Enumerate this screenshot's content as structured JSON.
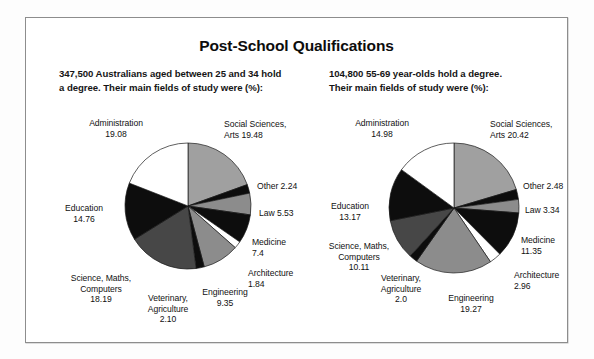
{
  "title": "Post-School Qualifications",
  "captions": {
    "left": "347,500 Australians aged between 25 and 34 hold\na degree. Their main fields of study were (%):",
    "right": "104,800 55-69 year-olds hold a degree.\nTheir main fields of study were (%):"
  },
  "colors": {
    "gray_light": "#a0a0a0",
    "gray_mid": "#8c8c8c",
    "gray_dark": "#474747",
    "black": "#0d0d0d",
    "white": "#ffffff",
    "border": "#8d8d8d",
    "text": "#111111"
  },
  "chart_data": [
    {
      "type": "pie",
      "title": "347,500 Australians aged between 25 and 34 hold a degree. Their main fields of study were (%):",
      "group": "25-34 year-olds",
      "total_people": "347,500",
      "unit": "%",
      "start_angle": 0,
      "direction": "clockwise",
      "categories": [
        "Social Sciences, Arts",
        "Other",
        "Law",
        "Medicine",
        "Architecture",
        "Engineering",
        "Veterinary, Agriculture",
        "Science, Maths, Computers",
        "Education",
        "Administration"
      ],
      "values": [
        19.48,
        2.24,
        5.53,
        7.4,
        1.84,
        9.35,
        2.1,
        18.19,
        14.76,
        19.08
      ],
      "slice_colors": [
        "#a0a0a0",
        "#0d0d0d",
        "#8c8c8c",
        "#0d0d0d",
        "#ffffff",
        "#8c8c8c",
        "#0d0d0d",
        "#474747",
        "#0d0d0d",
        "#ffffff"
      ],
      "labels": [
        {
          "name": "Social Sciences,\nArts  19.48",
          "value": 19.48
        },
        {
          "name": "Other  2.24",
          "value": 2.24
        },
        {
          "name": "Law  5.53",
          "value": 5.53
        },
        {
          "name": "Medicine\n7.4",
          "value": 7.4
        },
        {
          "name": "Architecture\n1.84",
          "value": 1.84
        },
        {
          "name": "Engineering\n9.35",
          "value": 9.35
        },
        {
          "name": "Veterinary,\nAgriculture\n2.10",
          "value": 2.1
        },
        {
          "name": "Science, Maths,\nComputers\n18.19",
          "value": 18.19
        },
        {
          "name": "Education\n14.76",
          "value": 14.76
        },
        {
          "name": "Administration\n19.08",
          "value": 19.08
        }
      ]
    },
    {
      "type": "pie",
      "title": "104,800 55-69 year-olds hold a degree. Their main fields of study were (%):",
      "group": "55-69 year-olds",
      "total_people": "104,800",
      "unit": "%",
      "start_angle": 0,
      "direction": "clockwise",
      "categories": [
        "Social Sciences, Arts",
        "Other",
        "Law",
        "Medicine",
        "Architecture",
        "Engineering",
        "Veterinary, Agriculture",
        "Science, Maths, Computers",
        "Education",
        "Administration"
      ],
      "values": [
        20.42,
        2.48,
        3.34,
        11.35,
        2.96,
        19.27,
        2.0,
        10.11,
        13.17,
        14.98
      ],
      "slice_colors": [
        "#a0a0a0",
        "#0d0d0d",
        "#8c8c8c",
        "#0d0d0d",
        "#ffffff",
        "#8c8c8c",
        "#0d0d0d",
        "#474747",
        "#0d0d0d",
        "#ffffff"
      ],
      "labels": [
        {
          "name": "Social Sciences,\nArts  20.42",
          "value": 20.42
        },
        {
          "name": "Other  2.48",
          "value": 2.48
        },
        {
          "name": "Law  3.34",
          "value": 3.34
        },
        {
          "name": "Medicine\n11.35",
          "value": 11.35
        },
        {
          "name": "Architecture\n2.96",
          "value": 2.96
        },
        {
          "name": "Engineering\n19.27",
          "value": 19.27
        },
        {
          "name": "Veterinary,\nAgriculture\n2.0",
          "value": 2.0
        },
        {
          "name": "Science, Maths,\nComputers\n10.11",
          "value": 10.11
        },
        {
          "name": "Education\n13.17",
          "value": 13.17
        },
        {
          "name": "Administration\n14.98",
          "value": 14.98
        }
      ]
    }
  ]
}
